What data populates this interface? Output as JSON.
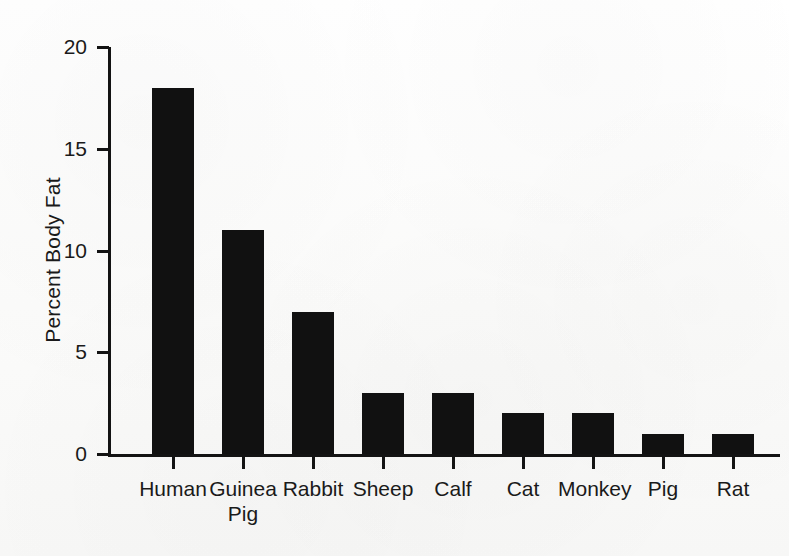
{
  "chart_data": {
    "type": "bar",
    "title": "",
    "xlabel": "",
    "ylabel": "Percent Body Fat",
    "categories": [
      "Human",
      "Guinea\nPig",
      "Rabbit",
      "Sheep",
      "Calf",
      "Cat",
      "Monkey",
      "Pig",
      "Rat"
    ],
    "values": [
      18,
      11,
      7,
      3,
      3,
      2,
      2,
      1,
      1
    ],
    "ylim": [
      0,
      20
    ],
    "ytick_labels": [
      "0",
      "5",
      "10",
      "15",
      "20"
    ],
    "ytick_values": [
      0,
      5,
      10,
      15,
      20
    ],
    "grid": false,
    "legend": false,
    "bar_color": "#111111",
    "axis_color": "#131313",
    "background_color": "#fdfdfc"
  },
  "axis": {
    "y_title": "Percent Body Fat"
  }
}
